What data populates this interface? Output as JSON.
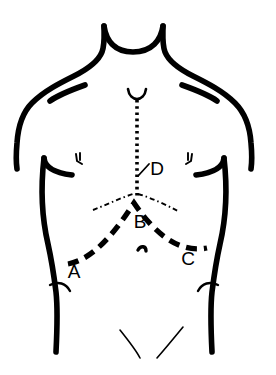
{
  "figure": {
    "background_color": "#ffffff",
    "ink_color": "#000000"
  },
  "labels": [
    {
      "id": "A",
      "text": "A",
      "name": "incision-label-a",
      "x": 74,
      "y": 272,
      "description": "left lateral end of chevron incision"
    },
    {
      "id": "B",
      "text": "B",
      "name": "incision-label-b",
      "x": 140,
      "y": 222,
      "description": "apex of chevron incision"
    },
    {
      "id": "C",
      "text": "C",
      "name": "incision-label-c",
      "x": 188,
      "y": 259,
      "description": "right lateral end of chevron incision"
    },
    {
      "id": "D",
      "text": "D",
      "name": "incision-label-d",
      "x": 157,
      "y": 170,
      "description": "midline vertical incision"
    }
  ],
  "incisions": {
    "midline_vertical": {
      "name": "midline-incision-line",
      "style": "fine dotted",
      "label_ref": "D",
      "path": "M 137 98 L 137 196",
      "dash": "2.5 3.5",
      "width": 3.6
    },
    "chevron": {
      "name": "chevron-incision-line",
      "style": "bold dashed",
      "label_refs": [
        "A",
        "B",
        "C"
      ],
      "path": "M 68 263 C 92 259 112 238 135 203 C 158 236 180 252 206 247",
      "dash": "11 7",
      "width": 5.2
    },
    "costal_margin": {
      "name": "costal-margin-line",
      "style": "thin dash-dot",
      "path_left": "M 92 208 C 105 203 120 197 134 193",
      "path_right": "M 136 193 C 151 197 166 203 178 209",
      "dash": "5 3 1.5 3",
      "width": 1.8
    }
  },
  "body_outline": {
    "name": "torso-outline",
    "stroke_width": 5.6,
    "features": [
      "neck",
      "trapezius",
      "shoulders",
      "arms",
      "pectoral-folds",
      "nipples",
      "flanks",
      "iliac-crests",
      "umbilicus",
      "inguinal-creases"
    ]
  }
}
